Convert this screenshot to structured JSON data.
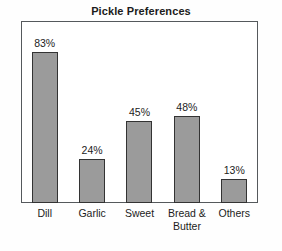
{
  "chart_data": {
    "type": "bar",
    "title": "Pickle Preferences",
    "xlabel": "",
    "ylabel": "",
    "ylim": [
      0,
      100
    ],
    "grid": false,
    "legend": false,
    "categories": [
      "Dill",
      "Garlic",
      "Sweet",
      "Bread &\nButter",
      "Others"
    ],
    "values": [
      83,
      24,
      45,
      48,
      13
    ],
    "value_labels": [
      "83%",
      "24%",
      "45%",
      "48%",
      "13%"
    ],
    "bar_color": "#9b9b9b",
    "bar_edge_color": "#333333",
    "frame_color": "#55595c",
    "background": "#ffffff"
  }
}
